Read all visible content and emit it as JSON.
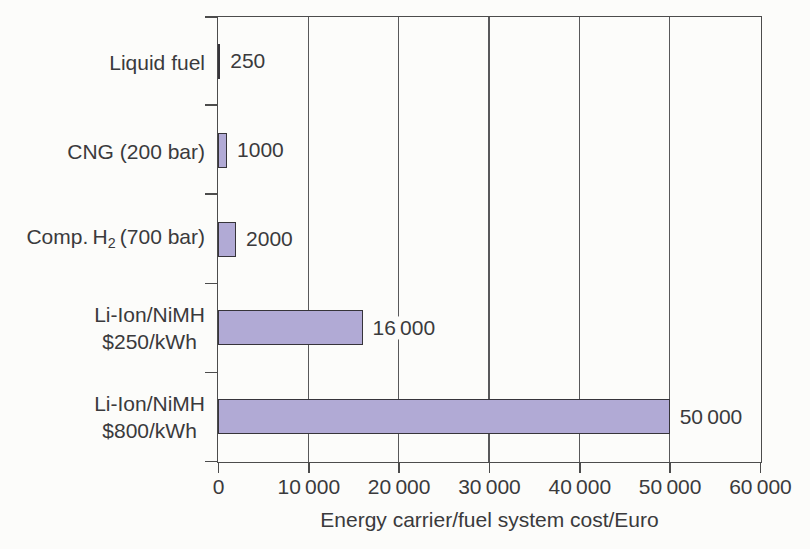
{
  "chart_data": {
    "type": "bar",
    "orientation": "horizontal",
    "title": "",
    "xlabel": "Energy carrier/fuel system cost/Euro",
    "ylabel": "",
    "xlim": [
      0,
      60000
    ],
    "grid": "vertical gridlines at every x tick, full plot height",
    "legend": "none",
    "x_ticks": [
      {
        "value": 0,
        "label": "0"
      },
      {
        "value": 10000,
        "label": "10 000"
      },
      {
        "value": 20000,
        "label": "20 000"
      },
      {
        "value": 30000,
        "label": "30 000"
      },
      {
        "value": 40000,
        "label": "40 000"
      },
      {
        "value": 50000,
        "label": "50 000"
      },
      {
        "value": 60000,
        "label": "60 000"
      }
    ],
    "rows": [
      {
        "category": "Liquid fuel",
        "value": 250,
        "value_label": "250",
        "label_lines": [
          [
            {
              "text": "Liquid fuel"
            }
          ]
        ]
      },
      {
        "category": "CNG (200 bar)",
        "value": 1000,
        "value_label": "1000",
        "label_lines": [
          [
            {
              "text": "CNG (200 bar)"
            }
          ]
        ]
      },
      {
        "category": "Comp. H2 (700 bar)",
        "value": 2000,
        "value_label": "2000",
        "label_lines": [
          [
            {
              "text": "Comp. H"
            },
            {
              "text": "2",
              "subscript": true
            },
            {
              "text": " (700 bar)"
            }
          ]
        ]
      },
      {
        "category": "Li-Ion/NiMH $250/kWh",
        "value": 16000,
        "value_label": "16 000",
        "label_lines": [
          [
            {
              "text": "Li-Ion/NiMH"
            }
          ],
          [
            {
              "text": "$250/kWh"
            }
          ]
        ]
      },
      {
        "category": "Li-Ion/NiMH $800/kWh",
        "value": 50000,
        "value_label": "50 000",
        "label_lines": [
          [
            {
              "text": "Li-Ion/NiMH"
            }
          ],
          [
            {
              "text": "$800/kWh"
            }
          ]
        ]
      }
    ],
    "colors": {
      "bar_fill": "#b1aad5",
      "bar_border": "#36343a",
      "axis_line": "#4c4c4c",
      "gridline": "#58585a",
      "text": "#3a3a3c",
      "background": "#fcfcfa"
    }
  }
}
